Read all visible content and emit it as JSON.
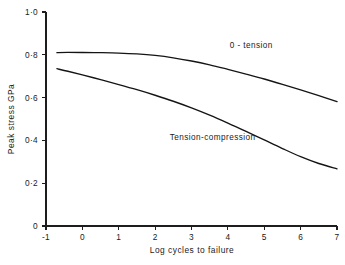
{
  "chart_data": {
    "type": "line",
    "title": "",
    "xlabel": "Log cycles to failure",
    "ylabel": "Peak stress GPa",
    "xlim": [
      -1,
      7
    ],
    "ylim": [
      0,
      1.0
    ],
    "grid": false,
    "legend_position": "inline-annotation",
    "x_ticks": [
      {
        "value": -1,
        "label": "-1"
      },
      {
        "value": 0,
        "label": "0"
      },
      {
        "value": 1,
        "label": "1"
      },
      {
        "value": 2,
        "label": "2"
      },
      {
        "value": 3,
        "label": "3"
      },
      {
        "value": 4,
        "label": "4"
      },
      {
        "value": 5,
        "label": "5"
      },
      {
        "value": 6,
        "label": "6"
      },
      {
        "value": 7,
        "label": "7"
      }
    ],
    "y_ticks": [
      {
        "value": 0,
        "label": "0"
      },
      {
        "value": 0.2,
        "label": "0·2"
      },
      {
        "value": 0.4,
        "label": "0·4"
      },
      {
        "value": 0.6,
        "label": "0·6"
      },
      {
        "value": 0.8,
        "label": "0·8"
      },
      {
        "value": 1.0,
        "label": "1·0"
      }
    ],
    "series": [
      {
        "name": "0 - tension",
        "label": "0 - tension",
        "label_x": 4.05,
        "label_y": 0.845,
        "color": "#141414",
        "x": [
          -0.7,
          -0.4,
          0.0,
          0.5,
          1.0,
          1.5,
          2.0,
          2.5,
          3.0,
          3.5,
          4.0,
          4.5,
          5.0,
          5.5,
          6.0,
          6.5,
          7.0
        ],
        "y": [
          0.81,
          0.811,
          0.811,
          0.81,
          0.808,
          0.804,
          0.797,
          0.786,
          0.771,
          0.753,
          0.732,
          0.71,
          0.687,
          0.662,
          0.636,
          0.609,
          0.581
        ]
      },
      {
        "name": "Tension-compression",
        "label": "Tension-compression",
        "label_x": 2.4,
        "label_y": 0.415,
        "color": "#141414",
        "x": [
          -0.7,
          -0.4,
          0.0,
          0.5,
          1.0,
          1.5,
          2.0,
          2.5,
          3.0,
          3.5,
          4.0,
          4.5,
          5.0,
          5.5,
          6.0,
          6.5,
          7.0
        ],
        "y": [
          0.735,
          0.723,
          0.706,
          0.684,
          0.661,
          0.637,
          0.611,
          0.583,
          0.552,
          0.518,
          0.481,
          0.442,
          0.402,
          0.362,
          0.324,
          0.292,
          0.267
        ]
      }
    ]
  },
  "axes": {
    "x_axis_title": "Log cycles to failure",
    "y_axis_title": "Peak stress GPa"
  }
}
